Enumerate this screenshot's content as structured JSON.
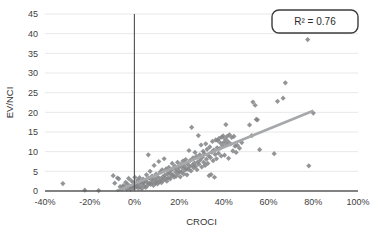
{
  "chart_data": {
    "type": "scatter",
    "title": "",
    "xlabel": "CROCI",
    "ylabel": "EV/NCI",
    "xlim": [
      -40,
      100
    ],
    "ylim": [
      0,
      45
    ],
    "xticks": [
      "-40%",
      "-20%",
      "0%",
      "20%",
      "40%",
      "60%",
      "80%",
      "100%"
    ],
    "xtick_values": [
      -40,
      -20,
      0,
      20,
      40,
      60,
      80,
      100
    ],
    "yticks": [
      "0",
      "5",
      "10",
      "15",
      "20",
      "25",
      "30",
      "35",
      "40",
      "45"
    ],
    "ytick_values": [
      0,
      5,
      10,
      15,
      20,
      25,
      30,
      35,
      40,
      45
    ],
    "grid": "horizontal",
    "legend_position": "top-right",
    "marker": "diamond",
    "marker_color": "#808285",
    "trendline_color": "#a6a8ab",
    "axis_color": "#595959",
    "gridline_color": "#e8e8e8",
    "annotations": [
      {
        "name": "r-squared",
        "text": "R² = 0.76"
      }
    ],
    "trendline": {
      "x0": -8,
      "y0": 0,
      "x1": 80,
      "y1": 20.4
    },
    "series": [
      {
        "name": "companies",
        "points": [
          [
            -32.0,
            1.9
          ],
          [
            -22.2,
            0.2
          ],
          [
            -16.0,
            0.1
          ],
          [
            -9.5,
            3.9
          ],
          [
            -8.8,
            2.0
          ],
          [
            -7.6,
            3.3
          ],
          [
            -7.0,
            3.1
          ],
          [
            -6.4,
            1.1
          ],
          [
            -5.5,
            0.6
          ],
          [
            -5.0,
            1.4
          ],
          [
            -4.4,
            1.0
          ],
          [
            -3.9,
            2.2
          ],
          [
            -3.4,
            0.5
          ],
          [
            -3.0,
            1.7
          ],
          [
            -2.6,
            3.2
          ],
          [
            -2.2,
            1.0
          ],
          [
            -1.8,
            0.4
          ],
          [
            -1.4,
            2.6
          ],
          [
            -1.0,
            1.2
          ],
          [
            -0.6,
            0.8
          ],
          [
            -0.3,
            2.1
          ],
          [
            0.0,
            1.5
          ],
          [
            0.2,
            3.5
          ],
          [
            0.5,
            0.9
          ],
          [
            0.8,
            2.0
          ],
          [
            1.1,
            1.3
          ],
          [
            1.4,
            2.8
          ],
          [
            1.7,
            0.7
          ],
          [
            2.0,
            1.9
          ],
          [
            2.3,
            3.4
          ],
          [
            2.6,
            1.1
          ],
          [
            3.0,
            2.4
          ],
          [
            3.3,
            0.6
          ],
          [
            3.6,
            1.8
          ],
          [
            3.9,
            3.0
          ],
          [
            4.2,
            2.1
          ],
          [
            4.5,
            1.2
          ],
          [
            4.8,
            2.7
          ],
          [
            5.1,
            0.9
          ],
          [
            5.4,
            4.1
          ],
          [
            5.7,
            2.2
          ],
          [
            6.0,
            1.5
          ],
          [
            6.2,
            9.2
          ],
          [
            6.4,
            3.3
          ],
          [
            6.7,
            2.0
          ],
          [
            7.0,
            5.0
          ],
          [
            7.3,
            1.7
          ],
          [
            7.6,
            2.9
          ],
          [
            7.9,
            3.8
          ],
          [
            8.2,
            2.3
          ],
          [
            8.5,
            1.4
          ],
          [
            8.8,
            6.5
          ],
          [
            9.1,
            3.1
          ],
          [
            9.4,
            2.0
          ],
          [
            9.7,
            4.3
          ],
          [
            10.0,
            2.6
          ],
          [
            10.3,
            1.8
          ],
          [
            10.6,
            3.5
          ],
          [
            10.9,
            7.5
          ],
          [
            11.2,
            2.4
          ],
          [
            11.5,
            4.8
          ],
          [
            11.8,
            3.0
          ],
          [
            12.1,
            2.1
          ],
          [
            12.4,
            5.4
          ],
          [
            12.7,
            3.6
          ],
          [
            13.0,
            2.7
          ],
          [
            13.3,
            8.2
          ],
          [
            13.6,
            4.0
          ],
          [
            13.9,
            3.2
          ],
          [
            14.2,
            5.6
          ],
          [
            14.5,
            2.5
          ],
          [
            14.8,
            4.4
          ],
          [
            15.1,
            3.4
          ],
          [
            15.4,
            6.0
          ],
          [
            15.7,
            4.6
          ],
          [
            16.0,
            3.1
          ],
          [
            16.3,
            5.2
          ],
          [
            16.6,
            3.9
          ],
          [
            16.9,
            7.0
          ],
          [
            17.2,
            4.2
          ],
          [
            17.5,
            5.8
          ],
          [
            17.8,
            3.5
          ],
          [
            18.1,
            6.3
          ],
          [
            18.4,
            4.9
          ],
          [
            18.7,
            3.8
          ],
          [
            19.0,
            5.5
          ],
          [
            19.3,
            7.3
          ],
          [
            19.6,
            4.5
          ],
          [
            19.9,
            6.1
          ],
          [
            20.2,
            5.0
          ],
          [
            20.5,
            3.6
          ],
          [
            20.8,
            6.8
          ],
          [
            21.1,
            4.8
          ],
          [
            21.4,
            5.9
          ],
          [
            21.7,
            7.6
          ],
          [
            22.0,
            4.3
          ],
          [
            22.3,
            6.4
          ],
          [
            22.6,
            5.3
          ],
          [
            22.9,
            8.0
          ],
          [
            23.2,
            5.7
          ],
          [
            23.5,
            4.1
          ],
          [
            23.8,
            6.9
          ],
          [
            24.1,
            5.5
          ],
          [
            24.4,
            10.3
          ],
          [
            24.7,
            6.2
          ],
          [
            25.0,
            7.8
          ],
          [
            25.3,
            5.1
          ],
          [
            25.6,
            16.2
          ],
          [
            25.9,
            6.6
          ],
          [
            26.2,
            8.4
          ],
          [
            26.5,
            5.9
          ],
          [
            26.8,
            7.1
          ],
          [
            27.1,
            9.8
          ],
          [
            27.4,
            6.3
          ],
          [
            27.7,
            8.8
          ],
          [
            28.0,
            5.4
          ],
          [
            28.3,
            7.4
          ],
          [
            28.6,
            14.1
          ],
          [
            28.9,
            6.8
          ],
          [
            29.2,
            9.2
          ],
          [
            29.5,
            7.9
          ],
          [
            29.8,
            11.7
          ],
          [
            30.1,
            6.1
          ],
          [
            30.4,
            8.6
          ],
          [
            30.7,
            10.1
          ],
          [
            31.0,
            7.3
          ],
          [
            31.3,
            9.5
          ],
          [
            31.6,
            6.5
          ],
          [
            31.9,
            12.0
          ],
          [
            32.2,
            8.1
          ],
          [
            32.5,
            10.6
          ],
          [
            32.8,
            7.0
          ],
          [
            33.1,
            9.0
          ],
          [
            33.4,
            3.9
          ],
          [
            33.7,
            11.2
          ],
          [
            34.0,
            8.5
          ],
          [
            34.3,
            4.2
          ],
          [
            34.6,
            9.9
          ],
          [
            34.9,
            12.6
          ],
          [
            35.2,
            7.7
          ],
          [
            35.5,
            10.4
          ],
          [
            35.8,
            3.5
          ],
          [
            36.1,
            9.3
          ],
          [
            36.4,
            13.0
          ],
          [
            36.7,
            8.2
          ],
          [
            37.0,
            11.0
          ],
          [
            37.3,
            12.8
          ],
          [
            37.6,
            9.6
          ],
          [
            37.9,
            13.4
          ],
          [
            38.2,
            10.8
          ],
          [
            38.5,
            12.2
          ],
          [
            38.8,
            8.9
          ],
          [
            39.1,
            13.7
          ],
          [
            39.4,
            11.5
          ],
          [
            39.7,
            14.0
          ],
          [
            40.0,
            12.4
          ],
          [
            40.3,
            9.1
          ],
          [
            40.6,
            13.2
          ],
          [
            40.9,
            16.9
          ],
          [
            41.2,
            11.8
          ],
          [
            41.5,
            13.9
          ],
          [
            41.8,
            12.6
          ],
          [
            42.1,
            8.3
          ],
          [
            42.5,
            14.3
          ],
          [
            43.0,
            12.0
          ],
          [
            43.5,
            13.6
          ],
          [
            44.0,
            10.2
          ],
          [
            44.5,
            13.9
          ],
          [
            45.0,
            11.4
          ],
          [
            45.5,
            9.8
          ],
          [
            46.0,
            11.6
          ],
          [
            47.0,
            10.9
          ],
          [
            48.0,
            12.3
          ],
          [
            51.5,
            16.8
          ],
          [
            52.5,
            14.1
          ],
          [
            53.0,
            22.6
          ],
          [
            54.0,
            21.8
          ],
          [
            54.5,
            18.2
          ],
          [
            55.0,
            18.1
          ],
          [
            56.0,
            10.5
          ],
          [
            62.5,
            9.5
          ],
          [
            64.0,
            22.8
          ],
          [
            66.5,
            23.6
          ],
          [
            67.5,
            27.5
          ],
          [
            77.5,
            38.5
          ],
          [
            78.0,
            6.4
          ],
          [
            80.0,
            19.8
          ]
        ]
      }
    ]
  },
  "geometry": {
    "plot": {
      "left": 45,
      "top": 14,
      "right": 358,
      "bottom": 191
    }
  }
}
